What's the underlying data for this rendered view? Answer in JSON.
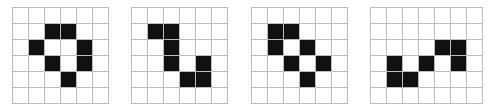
{
  "figure": {
    "cell_size": 16,
    "colors": {
      "filled": "#111111",
      "empty": "#ffffff",
      "grid_line": "#bdbdbd"
    },
    "grids": [
      {
        "left": 12,
        "rows": 6,
        "cols": 6,
        "filled": [
          [
            1,
            2
          ],
          [
            1,
            3
          ],
          [
            2,
            1
          ],
          [
            2,
            4
          ],
          [
            3,
            2
          ],
          [
            3,
            4
          ],
          [
            4,
            3
          ]
        ]
      },
      {
        "left": 131,
        "rows": 6,
        "cols": 6,
        "filled": [
          [
            1,
            1
          ],
          [
            1,
            2
          ],
          [
            2,
            2
          ],
          [
            3,
            2
          ],
          [
            3,
            4
          ],
          [
            4,
            3
          ],
          [
            4,
            4
          ]
        ]
      },
      {
        "left": 251,
        "rows": 6,
        "cols": 6,
        "filled": [
          [
            1,
            1
          ],
          [
            1,
            2
          ],
          [
            2,
            1
          ],
          [
            2,
            3
          ],
          [
            3,
            2
          ],
          [
            3,
            4
          ],
          [
            4,
            3
          ]
        ]
      },
      {
        "left": 370,
        "rows": 6,
        "cols": 7,
        "filled": [
          [
            2,
            4
          ],
          [
            2,
            5
          ],
          [
            3,
            1
          ],
          [
            3,
            3
          ],
          [
            3,
            5
          ],
          [
            4,
            1
          ],
          [
            4,
            2
          ]
        ]
      }
    ]
  }
}
